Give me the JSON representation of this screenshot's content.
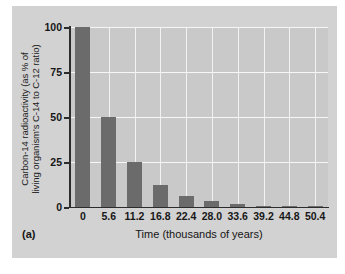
{
  "figure": {
    "panel_label": "(a)",
    "background_color": "#d2d2d2",
    "plot_background_color": "#c9c9c9",
    "bar_color": "#6b6b6b",
    "grid_color": "#f2f2f2"
  },
  "chart_data": {
    "type": "bar",
    "title": "",
    "xlabel": "Time (thousands of years)",
    "ylabel_line1": "Carbon-14 radioactivity (as % of",
    "ylabel_line2": "living organism's C-14 to C-12 ratio)",
    "categories": [
      "0",
      "5.6",
      "11.2",
      "16.8",
      "22.4",
      "28.0",
      "33.6",
      "39.2",
      "44.8",
      "50.4"
    ],
    "values": [
      100,
      50,
      25,
      12.5,
      6.25,
      3.125,
      1.5625,
      0.78,
      0.39,
      0.195
    ],
    "xtick_labels": [
      "0",
      "5.6",
      "11.2",
      "16.8",
      "22.4",
      "28.0",
      "33.6",
      "39.2",
      "44.8",
      "50.4"
    ],
    "ytick_labels": [
      "0",
      "25",
      "50",
      "75",
      "100"
    ],
    "ytick_values": [
      0,
      25,
      50,
      75,
      100
    ],
    "ylim": [
      0,
      100
    ],
    "grid": "on",
    "legend": "none"
  }
}
